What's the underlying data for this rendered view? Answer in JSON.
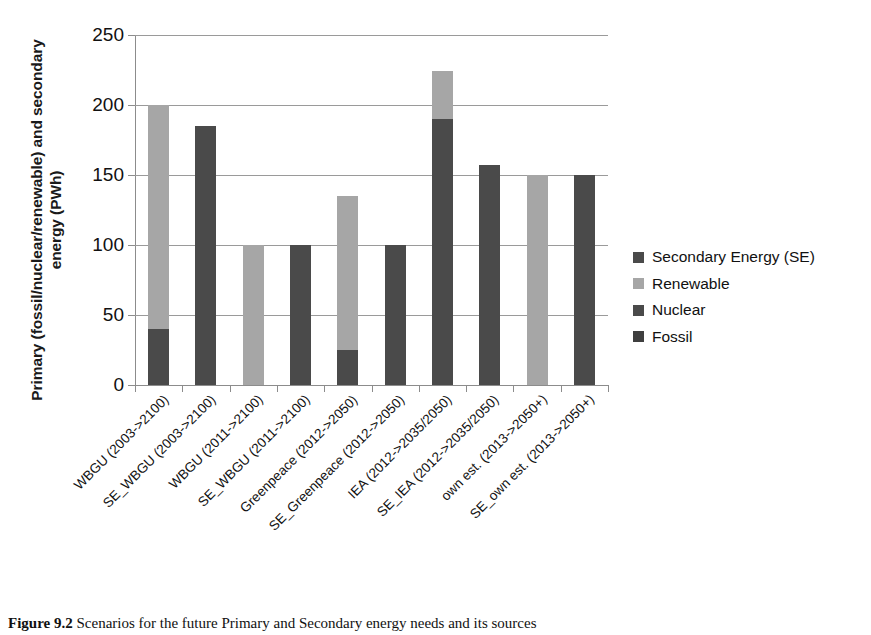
{
  "chart_data": {
    "type": "bar",
    "stacked": true,
    "title": "",
    "xlabel": "",
    "ylabel": "Primary (fossil/nuclear/renewable) and secondary energy (PWh)",
    "ylim": [
      0,
      250
    ],
    "yticks": [
      0,
      50,
      100,
      150,
      200,
      250
    ],
    "grid": true,
    "legend_position": "right",
    "categories": [
      "WBGU (2003->2100)",
      "SE_WBGU (2003->2100)",
      "WBGU (2011->2100)",
      "SE_WBGU (2011->2100)",
      "Greenpeace (2012->2050)",
      "SE_Greenpeace (2012->2050)",
      "IEA (2012->2035/2050)",
      "SE_IEA (2012->2035/2050)",
      "own est. (2013->2050+)",
      "SE_own est. (2013->2050+)"
    ],
    "series": [
      {
        "name": "Secondary Energy (SE)",
        "color": "#4a4a4a",
        "values": [
          0,
          185,
          0,
          100,
          0,
          100,
          0,
          157,
          0,
          150
        ]
      },
      {
        "name": "Renewable",
        "color": "#a6a6a6",
        "values": [
          160,
          0,
          100,
          0,
          110,
          0,
          34,
          0,
          150,
          0
        ]
      },
      {
        "name": "Nuclear",
        "color": "#4a4a4a",
        "values": [
          0,
          0,
          0,
          0,
          0,
          0,
          0,
          0,
          0,
          0
        ]
      },
      {
        "name": "Fossil",
        "color": "#4a4a4a",
        "values": [
          40,
          0,
          0,
          0,
          25,
          0,
          190,
          0,
          0,
          0
        ]
      }
    ],
    "bar_totals": [
      200,
      185,
      100,
      100,
      135,
      100,
      224,
      157,
      150,
      150
    ]
  },
  "legend": {
    "items": [
      {
        "label": "Secondary Energy (SE)",
        "color": "#4a4a4a"
      },
      {
        "label": "Renewable",
        "color": "#a6a6a6"
      },
      {
        "label": "Nuclear",
        "color": "#4a4a4a"
      },
      {
        "label": "Fossil",
        "color": "#3f3f3f"
      }
    ]
  },
  "caption": {
    "figure_number": "Figure 9.2",
    "text": "Scenarios for the future Primary and Secondary energy needs and its sources"
  },
  "colors": {
    "dark": "#4a4a4a",
    "light": "#a6a6a6",
    "axis": "#8c8c8c",
    "grid": "#9a9a9a"
  }
}
